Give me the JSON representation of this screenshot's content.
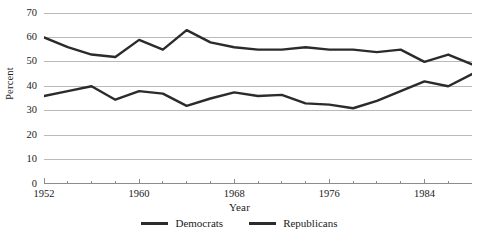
{
  "chart_data": {
    "type": "line",
    "title": "",
    "xlabel": "Year",
    "ylabel": "Percent",
    "xlim": [
      1952,
      1988
    ],
    "ylim": [
      0,
      70
    ],
    "grid": true,
    "legend_position": "bottom",
    "x": [
      1952,
      1954,
      1956,
      1958,
      1960,
      1962,
      1964,
      1966,
      1968,
      1970,
      1972,
      1974,
      1976,
      1978,
      1980,
      1982,
      1984,
      1986,
      1988
    ],
    "yticks": [
      0,
      10,
      20,
      30,
      40,
      50,
      60,
      70
    ],
    "ytick_labels": [
      "0",
      "10",
      "20",
      "30",
      "40",
      "50",
      "60",
      "70"
    ],
    "xticks": [
      1952,
      1960,
      1968,
      1976,
      1984
    ],
    "xtick_labels": [
      "1952",
      "1960",
      "1968",
      "1976",
      "1984"
    ],
    "xticks_minor": [
      1954,
      1956,
      1958,
      1962,
      1964,
      1966,
      1970,
      1972,
      1974,
      1978,
      1980,
      1982,
      1986,
      1988
    ],
    "series": [
      {
        "name": "Democrats",
        "color": "#2b2b2b",
        "values": [
          60,
          56,
          53,
          52,
          59,
          55,
          63,
          58,
          56,
          55,
          55,
          56,
          55,
          55,
          54,
          55,
          50,
          53,
          49
        ]
      },
      {
        "name": "Republicans",
        "color": "#2b2b2b",
        "values": [
          36,
          38,
          40,
          34.5,
          38,
          37,
          32,
          35,
          37.5,
          36,
          36.5,
          33,
          32.5,
          31,
          34,
          38,
          42,
          40,
          45
        ]
      }
    ]
  },
  "legend": {
    "entries": [
      {
        "label": "Democrats"
      },
      {
        "label": "Republicans"
      }
    ]
  },
  "axes": {
    "y_title": "Percent",
    "x_title": "Year"
  },
  "colors": {
    "line": "#2b2b2b",
    "grid": "#b9b9b9",
    "axis": "#8c8c8c",
    "background": "#ffffff",
    "text": "#1a1a1a"
  }
}
